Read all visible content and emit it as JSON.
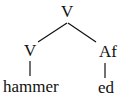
{
  "tree": {
    "root": {
      "label": "V"
    },
    "left": {
      "label": "V",
      "leaf": "hammer"
    },
    "right": {
      "label": "Af",
      "leaf": "ed"
    }
  }
}
